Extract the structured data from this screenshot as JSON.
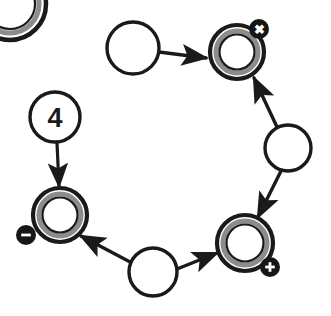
{
  "diagram": {
    "background_color": "#ffffff",
    "stroke_color": "#1a1a1a",
    "ring_inner_color": "#8c8c8c",
    "badge_fill": "#161616",
    "badge_glyph_color": "#ffffff",
    "nodes": [
      {
        "id": "node-corner-ring",
        "kind": "double-ring",
        "label": "",
        "cx": 10,
        "cy": 4,
        "r": 36,
        "partial": true,
        "badge": null
      },
      {
        "id": "node-plain-top",
        "kind": "plain",
        "label": "",
        "cx": 133,
        "cy": 48,
        "r": 26,
        "partial": false,
        "badge": null
      },
      {
        "id": "node-ring-x",
        "kind": "double-ring",
        "label": "",
        "cx": 237,
        "cy": 52,
        "r": 27,
        "partial": false,
        "badge": {
          "name": "close-badge",
          "glyph": "✖",
          "cx": 259,
          "cy": 29,
          "r": 10
        }
      },
      {
        "id": "node-plain-right",
        "kind": "plain",
        "label": "",
        "cx": 288,
        "cy": 148,
        "r": 23,
        "partial": false,
        "badge": null
      },
      {
        "id": "node-ring-plus",
        "kind": "double-ring",
        "label": "",
        "cx": 245,
        "cy": 243,
        "r": 28,
        "partial": false,
        "badge": {
          "name": "plus-badge",
          "glyph": "✚",
          "cx": 270,
          "cy": 267,
          "r": 10
        }
      },
      {
        "id": "node-plain-bottom",
        "kind": "plain",
        "label": "",
        "cx": 153,
        "cy": 272,
        "r": 24,
        "partial": false,
        "badge": null
      },
      {
        "id": "node-ring-minus",
        "kind": "double-ring",
        "label": "",
        "cx": 60,
        "cy": 215,
        "r": 27,
        "partial": false,
        "badge": {
          "name": "minus-badge",
          "glyph": "−",
          "cx": 26,
          "cy": 235,
          "r": 10
        }
      },
      {
        "id": "node-numbered-4",
        "kind": "plain",
        "label": "4",
        "cx": 55,
        "cy": 117,
        "r": 25,
        "partial": false,
        "badge": null
      }
    ],
    "edges": [
      {
        "id": "edge-top-to-x",
        "from": "node-plain-top",
        "to": "node-ring-x",
        "x1": 159,
        "y1": 52,
        "x2": 206,
        "y2": 58
      },
      {
        "id": "edge-right-to-x",
        "from": "node-plain-right",
        "to": "node-ring-x",
        "x1": 277,
        "y1": 127,
        "x2": 254,
        "y2": 78
      },
      {
        "id": "edge-right-to-plus",
        "from": "node-plain-right",
        "to": "node-ring-plus",
        "x1": 281,
        "y1": 171,
        "x2": 258,
        "y2": 217
      },
      {
        "id": "edge-bottom-to-plus",
        "from": "node-plain-bottom",
        "to": "node-ring-plus",
        "x1": 177,
        "y1": 269,
        "x2": 217,
        "y2": 253
      },
      {
        "id": "edge-bottom-to-minus",
        "from": "node-plain-bottom",
        "to": "node-ring-minus",
        "x1": 132,
        "y1": 263,
        "x2": 81,
        "y2": 236
      },
      {
        "id": "edge-four-to-minus",
        "from": "node-numbered-4",
        "to": "node-ring-minus",
        "x1": 57,
        "y1": 143,
        "x2": 59,
        "y2": 186
      }
    ]
  }
}
